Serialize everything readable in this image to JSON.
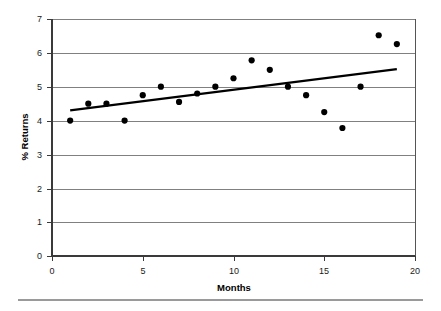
{
  "chart_data": {
    "type": "scatter",
    "title": "",
    "subtitle": "",
    "xlabel": "Months",
    "ylabel": "% Returns",
    "xlim": [
      0,
      20
    ],
    "ylim": [
      0,
      7
    ],
    "x_ticks": [
      0,
      5,
      10,
      15,
      20
    ],
    "x_tick_labels": [
      "0",
      "5",
      "10",
      "15",
      "20"
    ],
    "y_ticks": [
      0,
      1,
      2,
      3,
      4,
      5,
      6,
      7
    ],
    "y_tick_labels": [
      "0",
      "1",
      "2",
      "3",
      "4",
      "5",
      "6",
      "7"
    ],
    "grid": "horizontal",
    "legend": "none",
    "marker": "filled-circle",
    "marker_color": "#000000",
    "series": [
      {
        "name": "% Returns",
        "type": "scatter",
        "x": [
          1,
          2,
          3,
          4,
          5,
          6,
          7,
          8,
          9,
          10,
          11,
          12,
          13,
          14,
          15,
          16,
          17,
          18,
          19
        ],
        "values": [
          4.0,
          4.5,
          4.5,
          4.0,
          4.75,
          5.0,
          4.55,
          4.8,
          5.0,
          5.25,
          5.78,
          5.5,
          5.0,
          4.75,
          4.25,
          3.78,
          5.0,
          6.52,
          6.26
        ]
      },
      {
        "name": "Linear trend line",
        "type": "line",
        "color": "#000000",
        "x": [
          1,
          19
        ],
        "values": [
          4.3,
          5.52
        ]
      }
    ]
  },
  "figure": {
    "background_color": "#ffffff",
    "grid_color": "#808080",
    "axis_color": "#3a3a3a",
    "footer_rule_color": "#9a9a9a"
  }
}
